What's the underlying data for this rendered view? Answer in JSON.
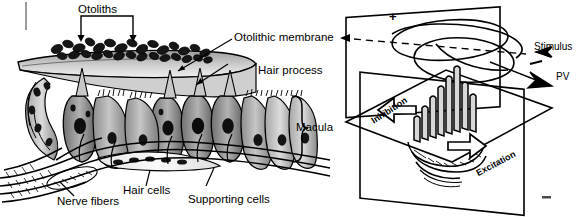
{
  "figure": {
    "panels": [
      {
        "id": "macula-cross-section",
        "name": "Macula cross-section",
        "labels": [
          {
            "key": "otoliths",
            "text": "Otoliths",
            "pointer": "bracket-with-two-down-arrows"
          },
          {
            "key": "otolithic_membrane",
            "text": "Otolithic membrane",
            "pointer": "leader-line-left"
          },
          {
            "key": "hair_process",
            "text": "Hair process",
            "pointer": "leader-line-left"
          },
          {
            "key": "macula",
            "text": "Macula",
            "pointer": "right-brace"
          },
          {
            "key": "nerve_fibers",
            "text": "Nerve fibers",
            "pointer": "leader-line-up"
          },
          {
            "key": "hair_cells",
            "text": "Hair cells",
            "pointer": "leader-line-up"
          },
          {
            "key": "supporting_cells",
            "text": "Supporting cells",
            "pointer": "leader-line-up"
          }
        ]
      },
      {
        "id": "directional-sensitivity",
        "name": "Hair cell polarization diagram",
        "labels": [
          {
            "key": "stimulus",
            "text": "Stimulus",
            "pointer": "open-arrow-right"
          },
          {
            "key": "pv",
            "text": "PV",
            "pointer": "solid-arrow-right"
          },
          {
            "key": "inhibition",
            "text": "Inhibition",
            "pointer": "outline-arrow-left"
          },
          {
            "key": "excitation",
            "text": "Excitation",
            "pointer": "outline-arrow-right"
          },
          {
            "key": "plus_sign",
            "text": "+",
            "pointer": "axis-positive-end"
          },
          {
            "key": "minus_sign",
            "text": "−",
            "pointer": "axis-negative-end"
          }
        ]
      }
    ],
    "colors": {
      "ink": "#000000",
      "membrane_fill": "#b4b4b4",
      "cell_fill_light": "#d2d2d2",
      "cell_fill_mid": "#9a9a9a",
      "cell_fill_dark": "#6e6e6e",
      "nucleus": "#121212",
      "background": "#ffffff"
    }
  }
}
